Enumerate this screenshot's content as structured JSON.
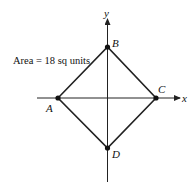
{
  "diagram": {
    "type": "coordinate-geometry",
    "axes": {
      "x_label": "x",
      "y_label": "y"
    },
    "area_label": "Area = 18 sq units",
    "points": [
      {
        "name": "A",
        "label": "A"
      },
      {
        "name": "B",
        "label": "B"
      },
      {
        "name": "C",
        "label": "C"
      },
      {
        "name": "D",
        "label": "D"
      }
    ],
    "shape": "square ABCD (rhombus) centered at origin, vertices on axes",
    "colors": {
      "line": "#222222",
      "background": "#ffffff"
    }
  }
}
